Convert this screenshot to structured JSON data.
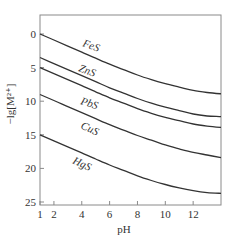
{
  "chart_data": {
    "type": "line",
    "title": "",
    "xlabel": "pH",
    "ylabel": "−lg[M²⁺]",
    "xlim": [
      1,
      14
    ],
    "ylim": [
      25,
      0
    ],
    "y_inverted": true,
    "grid": false,
    "legend": "inline labels on curves",
    "x_ticks": [
      1,
      2,
      4,
      6,
      8,
      10,
      12
    ],
    "y_ticks": [
      0,
      5,
      10,
      15,
      20,
      25
    ],
    "x": [
      1,
      2,
      3,
      4,
      5,
      6,
      7,
      8,
      9,
      10,
      11,
      12,
      13,
      14
    ],
    "series": [
      {
        "name": "FeS",
        "values": [
          0,
          0.9,
          1.8,
          2.7,
          3.6,
          4.5,
          5.3,
          6.1,
          6.8,
          7.4,
          7.9,
          8.4,
          8.7,
          8.9
        ]
      },
      {
        "name": "ZnS",
        "values": [
          3.5,
          4.4,
          5.3,
          6.2,
          7.1,
          8.0,
          8.8,
          9.6,
          10.3,
          10.9,
          11.4,
          11.9,
          12.2,
          12.3
        ]
      },
      {
        "name": "PbS",
        "values": [
          5,
          5.9,
          6.8,
          7.7,
          8.6,
          9.5,
          10.3,
          11.1,
          11.8,
          12.4,
          12.9,
          13.4,
          13.7,
          13.9
        ]
      },
      {
        "name": "CuS",
        "values": [
          9,
          9.9,
          10.8,
          11.7,
          12.6,
          13.5,
          14.3,
          15.1,
          15.8,
          16.5,
          17.1,
          17.6,
          18.0,
          18.4
        ]
      },
      {
        "name": "HgS",
        "values": [
          15,
          15.9,
          16.8,
          17.7,
          18.6,
          19.5,
          20.3,
          21.1,
          21.8,
          22.4,
          22.9,
          23.3,
          23.6,
          23.7
        ]
      }
    ]
  },
  "labels": {
    "xlabel": "pH",
    "ylabel": "−lg[M²⁺]",
    "x_ticks": [
      "1",
      "2",
      "4",
      "6",
      "8",
      "10",
      "12"
    ],
    "y_ticks": [
      "0",
      "5",
      "10",
      "15",
      "20",
      "25"
    ],
    "series": [
      "FeS",
      "ZnS",
      "PbS",
      "CuS",
      "HgS"
    ]
  },
  "colors": {
    "line": "#333333",
    "frame": "#888888"
  }
}
